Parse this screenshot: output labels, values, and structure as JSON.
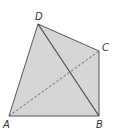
{
  "diagram": {
    "type": "geometry-quadrilateral",
    "fill_color": "#d6d6d6",
    "stroke_color": "#555555",
    "vertices": {
      "A": {
        "label": "A",
        "x": 9,
        "y": 116
      },
      "B": {
        "label": "B",
        "x": 99,
        "y": 116
      },
      "C": {
        "label": "C",
        "x": 99,
        "y": 51
      },
      "D": {
        "label": "D",
        "x": 38,
        "y": 24
      }
    },
    "edges": [
      "AB",
      "BC",
      "CD",
      "DA"
    ],
    "diagonals": [
      {
        "from": "D",
        "to": "B",
        "style": "solid"
      },
      {
        "from": "A",
        "to": "C",
        "style": "dashed"
      }
    ]
  }
}
